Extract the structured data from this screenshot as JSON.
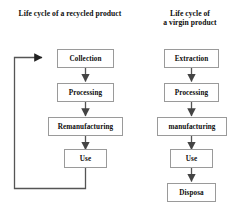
{
  "diagram": {
    "kind": "flowchart-pair",
    "background_color": "#ffffff",
    "box_border_color": "#9a9a9a",
    "connector_color": "#555555",
    "text_color": "#0d0d0d",
    "left_chart": {
      "title_line_1": "Life cycle of a recycled",
      "title_line_2": "product",
      "nodes": [
        {
          "id": "collection",
          "label": "Collection"
        },
        {
          "id": "processing",
          "label": "Processing"
        },
        {
          "id": "remanufacturing",
          "label": "Remanufacturing"
        },
        {
          "id": "use",
          "label": "Use"
        }
      ],
      "edges": [
        {
          "from": "collection",
          "to": "processing",
          "style": "arrow-down"
        },
        {
          "from": "processing",
          "to": "remanufacturing",
          "style": "arrow-down"
        },
        {
          "from": "remanufacturing",
          "to": "use",
          "style": "arrow-down"
        },
        {
          "from": "use",
          "to": "collection",
          "style": "feedback-loop-left"
        }
      ]
    },
    "right_chart": {
      "title_line_1": "Life cycle of",
      "title_line_2": "a virgin product",
      "nodes": [
        {
          "id": "extraction",
          "label": "Extraction"
        },
        {
          "id": "processing",
          "label": "Processing"
        },
        {
          "id": "manufacturing",
          "label": "manufacturing"
        },
        {
          "id": "use",
          "label": "Use"
        },
        {
          "id": "disposal",
          "label": "Disposa"
        }
      ],
      "edges": [
        {
          "from": "extraction",
          "to": "processing",
          "style": "arrow-down"
        },
        {
          "from": "processing",
          "to": "manufacturing",
          "style": "arrow-down"
        },
        {
          "from": "manufacturing",
          "to": "use",
          "style": "arrow-down"
        },
        {
          "from": "use",
          "to": "disposal",
          "style": "arrow-down"
        }
      ]
    }
  }
}
